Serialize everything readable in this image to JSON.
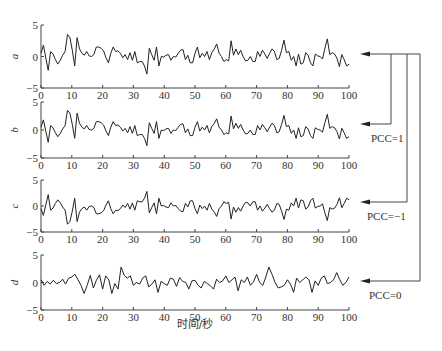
{
  "chart_data": [
    {
      "type": "line",
      "id": "a",
      "ylabel": "a",
      "xlabel": "",
      "xlim": [
        0,
        100
      ],
      "ylim": [
        -5,
        5
      ],
      "yticks": [
        -5,
        0,
        5
      ],
      "xticks": [
        0,
        10,
        20,
        30,
        40,
        50,
        60,
        70,
        80,
        90,
        100
      ],
      "x_step": 1,
      "values": [
        0.5,
        1.8,
        -0.2,
        -2.2,
        0.8,
        0.4,
        -0.5,
        -1.2,
        -0.6,
        0.2,
        0.8,
        3.5,
        3.0,
        1.0,
        -1.5,
        3.0,
        1.2,
        0.5,
        0.2,
        0.8,
        0.1,
        0.0,
        0.3,
        1.5,
        1.5,
        1.3,
        0.9,
        -0.2,
        -1.0,
        0.5,
        1.5,
        0.8,
        0.9,
        0.5,
        -0.2,
        0.3,
        -0.5,
        0.6,
        -0.6,
        0.8,
        -1.0,
        -0.8,
        -0.8,
        -1.5,
        -2.8,
        1.3,
        0.3,
        -0.6,
        1.5,
        -1.5,
        0.0,
        -0.1,
        0.2,
        0.3,
        -0.6,
        0.0,
        -0.1,
        0.5,
        1.0,
        1.1,
        -0.5,
        0.2,
        -1.0,
        -1.0,
        0.5,
        1.5,
        -0.2,
        0.5,
        0.0,
        0.8,
        -0.5,
        0.6,
        1.2,
        2.0,
        0.5,
        0.0,
        -0.8,
        -0.5,
        -0.7,
        2.5,
        0.2,
        1.2,
        0.3,
        1.0,
        0.0,
        -0.7,
        -0.6,
        0.0,
        -0.8,
        -0.8,
        0.8,
        0.0,
        1.0,
        0.4,
        -0.3,
        0.5,
        1.2,
        0.8,
        -0.5,
        -0.3,
        1.0,
        2.6,
        0.6,
        0.8,
        -0.6,
        0.0,
        -1.5,
        0.4,
        -1.2,
        -1.0,
        0.6,
        0.2,
        -1.0,
        -1.5,
        0.4,
        0.1,
        0.0,
        -0.4,
        1.3,
        2.8,
        0.3,
        0.6,
        0.4,
        -0.3,
        -1.6,
        0.3,
        -0.5,
        -1.5,
        -1.2
      ],
      "linked_to": "PCC=1, PCC=-1, PCC=0"
    },
    {
      "type": "line",
      "id": "b",
      "ylabel": "b",
      "xlim": [
        0,
        100
      ],
      "ylim": [
        -5,
        5
      ],
      "yticks": [
        -5,
        0,
        5
      ],
      "xticks": [
        0,
        10,
        20,
        30,
        40,
        50,
        60,
        70,
        80,
        90,
        100
      ],
      "relation": "identical to a",
      "annotation": "PCC=1"
    },
    {
      "type": "line",
      "id": "c",
      "ylabel": "c",
      "xlim": [
        0,
        100
      ],
      "ylim": [
        -5,
        5
      ],
      "yticks": [
        -5,
        0,
        5
      ],
      "xticks": [
        0,
        10,
        20,
        30,
        40,
        50,
        60,
        70,
        80,
        90,
        100
      ],
      "relation": "negation of a",
      "annotation": "PCC=-1"
    },
    {
      "type": "line",
      "id": "d",
      "ylabel": "d",
      "xlabel": "时间/秒",
      "xlim": [
        0,
        100
      ],
      "ylim": [
        -5,
        5
      ],
      "yticks": [
        -5,
        0,
        5
      ],
      "xticks": [
        0,
        10,
        20,
        30,
        40,
        50,
        60,
        70,
        80,
        90,
        100
      ],
      "x_step": 1,
      "values": [
        0.5,
        -0.5,
        0.2,
        -0.3,
        0.4,
        -0.2,
        0.0,
        0.6,
        -0.3,
        0.8,
        1.0,
        1.5,
        0.5,
        -0.5,
        -2.0,
        -0.5,
        1.3,
        -1.0,
        0.4,
        1.4,
        -1.2,
        1.2,
        0.5,
        -2.0,
        -0.2,
        -1.2,
        2.8,
        1.3,
        0.8,
        1.2,
        -0.5,
        0.0,
        -0.3,
        0.8,
        1.2,
        -0.8,
        -0.3,
        0.5,
        -1.8,
        0.2,
        -0.2,
        -0.5,
        0.8,
        0.6,
        -0.7,
        0.9,
        0.2,
        0.0,
        -1.2,
        0.3,
        0.4,
        -0.5,
        -1.0,
        0.2,
        -0.2,
        -0.6,
        -1.2,
        0.6,
        0.0,
        0.3,
        1.2,
        0.0,
        0.5,
        1.0,
        -1.5,
        0.5,
        0.0,
        1.0,
        -0.5,
        0.1,
        1.5,
        0.0,
        -0.5,
        1.0,
        2.8,
        1.5,
        0.0,
        -1.0,
        -0.8,
        -0.5,
        0.5,
        -0.3,
        -1.8,
        0.8,
        0.0,
        0.5,
        1.0,
        0.5,
        -1.8,
        0.3,
        -0.5,
        0.8,
        1.2,
        -0.2,
        0.0,
        0.5,
        1.8,
        0.5,
        -0.5,
        0.0,
        1.0
      ],
      "annotation": "PCC=0"
    }
  ],
  "figure": {
    "xlabel": "时间/秒",
    "panel_labels": [
      "a",
      "b",
      "c",
      "d"
    ],
    "pcc_labels": [
      "PCC=1",
      "PCC=−1",
      "PCC=0"
    ],
    "tick_text": {
      "y_top": "5",
      "y_mid": "0",
      "y_bottom": "−5",
      "x": [
        "0",
        "10",
        "20",
        "30",
        "40",
        "50",
        "60",
        "70",
        "80",
        "90",
        "100"
      ]
    },
    "line_color": "#222222",
    "axis_color": "#444444"
  }
}
